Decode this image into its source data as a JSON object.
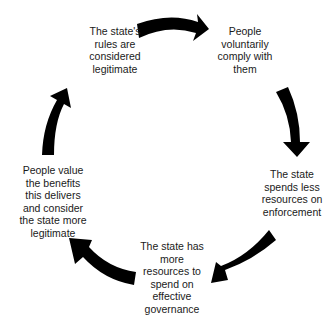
{
  "diagram": {
    "type": "cycle",
    "nodes": [
      {
        "id": "n1",
        "text": "The state's\nrules are\nconsidered\nlegitimate"
      },
      {
        "id": "n2",
        "text": "People\nvoluntarily\ncomply with\nthem"
      },
      {
        "id": "n3",
        "text": "The state\nspends less\nresources on\nenforcement"
      },
      {
        "id": "n4",
        "text": "The state has\nmore\nresources to\nspend on\neffective\ngovernance"
      },
      {
        "id": "n5",
        "text": "People value\nthe benefits\nthis delivers\nand consider\nthe state more\nlegitimate"
      }
    ],
    "edges": [
      {
        "from": "n1",
        "to": "n2"
      },
      {
        "from": "n2",
        "to": "n3"
      },
      {
        "from": "n3",
        "to": "n4"
      },
      {
        "from": "n4",
        "to": "n5"
      },
      {
        "from": "n5",
        "to": "n1"
      }
    ],
    "arrow_color": "#000000"
  }
}
